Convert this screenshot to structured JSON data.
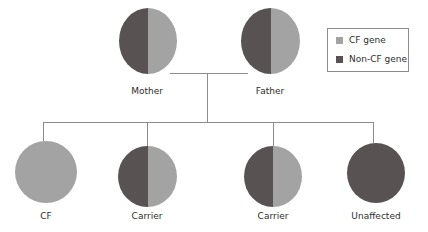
{
  "colors": {
    "cf_gene": "#a3a3a3",
    "non_cf_gene": "#585352",
    "line": "#8c8c8c"
  },
  "legend": {
    "items": [
      {
        "label": "CF gene",
        "color": "#a3a3a3"
      },
      {
        "label": "Non-CF gene",
        "color": "#585352"
      }
    ]
  },
  "parents": [
    {
      "label": "Mother",
      "left_allele": "Non-CF gene",
      "right_allele": "CF gene"
    },
    {
      "label": "Father",
      "left_allele": "Non-CF gene",
      "right_allele": "CF gene"
    }
  ],
  "children": [
    {
      "label": "CF",
      "left_allele": "CF gene",
      "right_allele": "CF gene"
    },
    {
      "label": "Carrier",
      "left_allele": "Non-CF gene",
      "right_allele": "CF gene"
    },
    {
      "label": "Carrier",
      "left_allele": "Non-CF gene",
      "right_allele": "CF gene"
    },
    {
      "label": "Unaffected",
      "left_allele": "Non-CF gene",
      "right_allele": "Non-CF gene"
    }
  ]
}
